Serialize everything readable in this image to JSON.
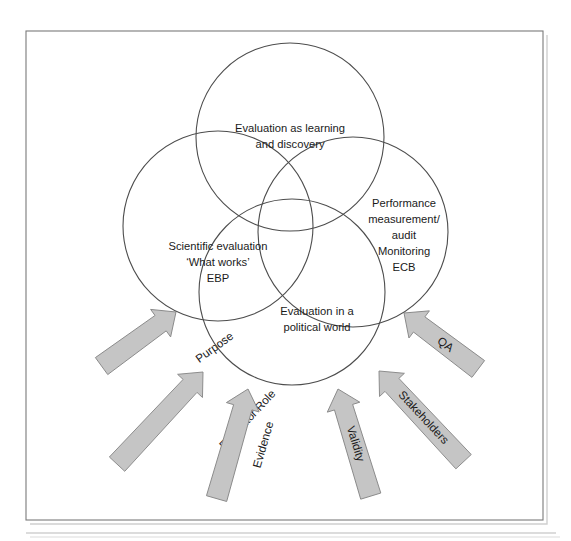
{
  "figure": {
    "background_color": "#ffffff",
    "frame": {
      "border_color": "#7a7a7a",
      "shadow_color": "#cfcfcf",
      "rule_color": "#b9b9b9"
    },
    "circle_stroke_color": "#4d4d4d",
    "arrow_fill_color": "#c5c5c5",
    "arrow_stroke_color": "#8a8a8a",
    "text_color": "#1a1a1a"
  },
  "circles": [
    {
      "id": "learning-discovery",
      "name": "Evaluation as learning and discovery",
      "cx": 290,
      "cy": 137,
      "r": 94,
      "lines": [
        "Evaluation as learning",
        "and discovery"
      ],
      "line1": "Evaluation as learning",
      "line2": "and discovery",
      "line3": "",
      "label_x": 290,
      "label_y": 128
    },
    {
      "id": "scientific-evaluation",
      "name": "Scientific evaluation 'What works' EBP",
      "cx": 218,
      "cy": 226,
      "r": 95,
      "lines": [
        "Scientific evaluation",
        "‘What works’",
        "EBP"
      ],
      "line1": "Scientific evaluation",
      "line2": "‘What works’",
      "line3": "EBP",
      "label_x": 218,
      "label_y": 246
    },
    {
      "id": "political-world",
      "name": "Evaluation in a political world",
      "cx": 292,
      "cy": 292,
      "r": 93,
      "lines": [
        "Evaluation in a",
        "political world"
      ],
      "line1": "Evaluation in a",
      "line2": "political world",
      "line3": "",
      "label_x": 317,
      "label_y": 311
    },
    {
      "id": "performance-measurement",
      "name": "Performance measurement/audit Monitoring ECB",
      "cx": 353,
      "cy": 232,
      "r": 95,
      "lines": [
        "Performance",
        "measurement/",
        "audit",
        "Monitoring",
        "ECB"
      ],
      "line1": "Performance",
      "line2": "measurement/",
      "line3": "audit",
      "line4": "Monitoring",
      "line5": "ECB",
      "label_x": 404,
      "label_y": 203
    }
  ],
  "arrows": [
    {
      "id": "purpose",
      "label": "Purpose",
      "angle": -36,
      "tip_x": 176,
      "tip_y": 312,
      "length": 92,
      "width": 21,
      "label_offset": 48
    },
    {
      "id": "evaluator-role",
      "label": "Evaluator Role",
      "angle": -47,
      "tip_x": 203,
      "tip_y": 372,
      "length": 126,
      "width": 21,
      "label_offset": 66
    },
    {
      "id": "evidence",
      "label": "Evidence",
      "angle": -74,
      "tip_x": 248,
      "tip_y": 389,
      "length": 114,
      "width": 21,
      "label_offset": 58
    },
    {
      "id": "validity",
      "label": "Validity",
      "angle": -107,
      "tip_x": 338,
      "tip_y": 389,
      "length": 112,
      "width": 21,
      "label_offset": 57
    },
    {
      "id": "stakeholders",
      "label": "Stakeholders",
      "angle": -133,
      "tip_x": 379,
      "tip_y": 371,
      "length": 124,
      "width": 21,
      "label_offset": 65
    },
    {
      "id": "qa",
      "label": "QA",
      "angle": -143,
      "tip_x": 404,
      "tip_y": 313,
      "length": 93,
      "width": 21,
      "label_offset": 49
    }
  ],
  "frame_geometry": {
    "x": 26,
    "y": 31,
    "width": 517,
    "height": 489,
    "rule_y": 533,
    "rule_x1": 26,
    "rule_x2": 556
  }
}
